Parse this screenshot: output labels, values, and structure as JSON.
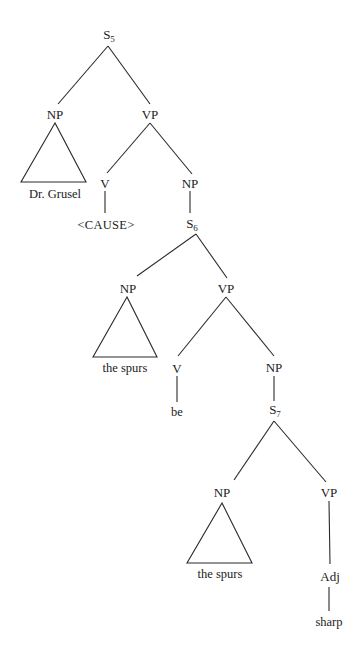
{
  "diagram": {
    "type": "syntax-tree",
    "nodes": {
      "s5": {
        "cat": "S",
        "sub": "5"
      },
      "np1": {
        "cat": "NP"
      },
      "np1_leaf": {
        "text": "Dr. Grusel"
      },
      "vp1": {
        "cat": "VP"
      },
      "v1": {
        "cat": "V"
      },
      "v1_leaf": {
        "text": "<CAUSE>"
      },
      "np2": {
        "cat": "NP"
      },
      "s6": {
        "cat": "S",
        "sub": "6"
      },
      "np3": {
        "cat": "NP"
      },
      "np3_leaf": {
        "text": "the spurs"
      },
      "vp2": {
        "cat": "VP"
      },
      "v2": {
        "cat": "V"
      },
      "v2_leaf": {
        "text": "be"
      },
      "np4": {
        "cat": "NP"
      },
      "s7": {
        "cat": "S",
        "sub": "7"
      },
      "np5": {
        "cat": "NP"
      },
      "np5_leaf": {
        "text": "the spurs"
      },
      "vp3": {
        "cat": "VP"
      },
      "adj": {
        "cat": "Adj"
      },
      "adj_leaf": {
        "text": "sharp"
      }
    },
    "edges": [
      [
        "S5",
        "NP"
      ],
      [
        "S5",
        "VP"
      ],
      [
        "NP",
        "triangle: Dr. Grusel"
      ],
      [
        "VP",
        "V"
      ],
      [
        "VP",
        "NP"
      ],
      [
        "V",
        "<CAUSE>"
      ],
      [
        "NP",
        "S6"
      ],
      [
        "S6",
        "NP"
      ],
      [
        "S6",
        "VP"
      ],
      [
        "NP",
        "triangle: the spurs"
      ],
      [
        "VP",
        "V"
      ],
      [
        "VP",
        "NP"
      ],
      [
        "V",
        "be"
      ],
      [
        "NP",
        "S7"
      ],
      [
        "S7",
        "NP"
      ],
      [
        "S7",
        "VP"
      ],
      [
        "NP",
        "triangle: the spurs"
      ],
      [
        "VP",
        "Adj"
      ],
      [
        "Adj",
        "sharp"
      ]
    ]
  }
}
